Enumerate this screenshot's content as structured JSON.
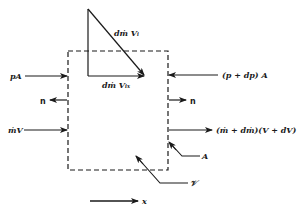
{
  "diagram": {
    "type": "control-volume momentum balance",
    "colors": {
      "ink": "#1a1a1a",
      "background": "#ffffff"
    },
    "labels": {
      "pressure_in": "pA",
      "pressure_out": "(p + dp) A",
      "normal_left": "n",
      "normal_right": "n",
      "momentum_in": "ṁV",
      "momentum_out": "(ṁ + dṁ)(V + dV)",
      "injected_momentum": "dṁ  Vᵢ",
      "injected_momentum_x": "dṁ  Vᵢₓ",
      "area": "A",
      "volume": "𝒱",
      "axis": "x"
    }
  }
}
